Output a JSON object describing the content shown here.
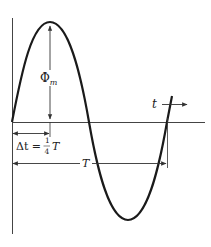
{
  "diagram": {
    "type": "sine-wave-period-annotation",
    "labels": {
      "amplitude": "Φ",
      "amplitude_sub": "m",
      "time_axis": "t",
      "delta_t_lhs": "Δt =",
      "delta_t_frac_num": "1",
      "delta_t_frac_den": "4",
      "delta_t_rhs": "T",
      "period": "T"
    },
    "colors": {
      "curve": "#1a1a1a",
      "axis": "#444444",
      "annotation": "#333333",
      "background": "#ffffff"
    }
  }
}
